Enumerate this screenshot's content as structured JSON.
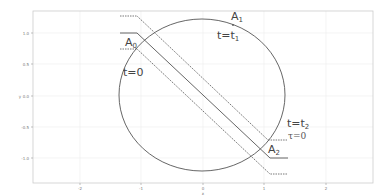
{
  "figure": {
    "axes": {
      "x_ticks": [
        {
          "label": "-2",
          "px": 80
        },
        {
          "label": "-1",
          "px": 141
        },
        {
          "label": "0",
          "px": 203
        },
        {
          "label": "1",
          "px": 264
        },
        {
          "label": "2",
          "px": 326
        }
      ],
      "y_ticks": [
        {
          "label": "1.0",
          "py": 33
        },
        {
          "label": "0.5",
          "py": 64
        },
        {
          "label": "0.0",
          "py": 96
        },
        {
          "label": "-0.5",
          "py": 127
        },
        {
          "label": "-1.0",
          "py": 158
        }
      ],
      "x_label": "x",
      "y_label": "y"
    },
    "annotations": {
      "a0": {
        "base": "A",
        "sub": "0"
      },
      "a1": {
        "base": "A",
        "sub": "1"
      },
      "a2": {
        "base": "A",
        "sub": "2"
      },
      "t0": "t=0",
      "t1": {
        "base": "t=t",
        "sub": "1"
      },
      "t2": {
        "base": "t=t",
        "sub": "2"
      },
      "tau0": "τ=0"
    },
    "colors": {
      "line": "#555555",
      "grid": "#e6e6e6",
      "frame": "#cccccc"
    }
  }
}
